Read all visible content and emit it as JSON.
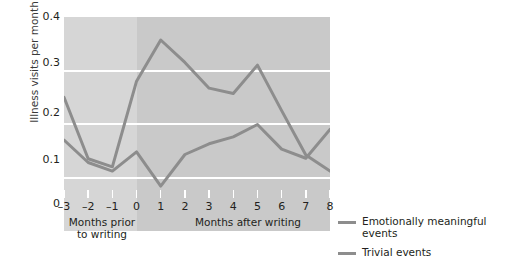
{
  "chart_data": {
    "type": "line",
    "title": "",
    "xlabel": "Months after writing",
    "xlabel_left": "Months prior\nto writing",
    "ylabel": "Illness visits per month",
    "x": [
      -3,
      -2,
      -1,
      0,
      1,
      2,
      3,
      4,
      5,
      6,
      7,
      8
    ],
    "xticklabels": [
      "–3",
      "–2",
      "–1",
      "0",
      "1",
      "2",
      "3",
      "4",
      "5",
      "6",
      "7",
      "8"
    ],
    "yticklabels": [
      "0",
      "0.1",
      "0.2",
      "0.3",
      "0.4"
    ],
    "ytickvalues": [
      0,
      0.1,
      0.2,
      0.3,
      0.4
    ],
    "ylim": [
      0,
      0.4
    ],
    "xlim": [
      -3,
      8
    ],
    "grid": "horizontal-white",
    "legend_position": "right",
    "series": [
      {
        "name": "Emotionally meaningful events",
        "color": "#8d8d8d",
        "values": [
          0.17,
          0.128,
          0.112,
          0.148,
          0.084,
          0.143,
          0.163,
          0.176,
          0.199,
          0.153,
          0.136,
          0.19
        ]
      },
      {
        "name": "Trivial events",
        "color": "#8d8d8d",
        "values": [
          0.25,
          0.135,
          0.12,
          0.28,
          0.357,
          0.315,
          0.267,
          0.257,
          0.31,
          0.225,
          0.142,
          0.112
        ]
      }
    ],
    "annotations": {
      "shaded_region_note": "lighter shading for months prior to writing (x from -3 to 0)"
    }
  },
  "legend": {
    "items": [
      {
        "label_line1": "Emotionally meaningful",
        "label_line2": "events"
      },
      {
        "label_line1": "Trivial events",
        "label_line2": ""
      }
    ]
  },
  "axis": {
    "x_caption_left": "Months prior",
    "x_caption_left2": "to writing",
    "x_caption_right": "Months after writing",
    "y_title": "Illness visits per month"
  },
  "colors": {
    "plot_background": "#c9c9c9",
    "pre_writing_background": "#d6d6d6",
    "gridline": "#ffffff",
    "line": "#8d8d8d",
    "text": "#231f20"
  }
}
